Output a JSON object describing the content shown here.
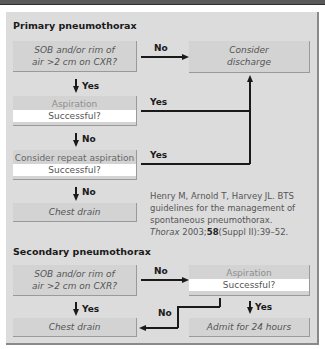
{
  "primary": {
    "title": "Primary pneumothorax",
    "q1": {
      "line1": "SOB and/or rim of",
      "line2": "air >2 cm on CXR?"
    },
    "q1_no": "No",
    "q1_yes": "Yes",
    "discharge": {
      "line1": "Consider",
      "line2": "discharge"
    },
    "aspiration": {
      "head": "Aspiration",
      "question": "Successful?"
    },
    "aspiration_yes": "Yes",
    "aspiration_no": "No",
    "repeat": {
      "head": "Consider repeat aspiration",
      "question": "Successful?"
    },
    "repeat_yes": "Yes",
    "repeat_no": "No",
    "chest_drain": "Chest drain"
  },
  "reference": {
    "line1": "Henry M, Arnold T, Harvey JL. BTS",
    "line2": "guidelines for the management of",
    "line3": "spontaneous pneumothorax.",
    "journal": "Thorax",
    "year": "2003;",
    "volume": "58",
    "pages": "(Suppl II):39–52."
  },
  "secondary": {
    "title": "Secondary pneumothorax",
    "q1": {
      "line1": "SOB and/or rim of",
      "line2": "air >2 cm on CXR?"
    },
    "q1_no": "No",
    "q1_yes": "Yes",
    "aspiration": {
      "head": "Aspiration",
      "question": "Successful?"
    },
    "aspiration_no": "No",
    "aspiration_yes": "Yes",
    "chest_drain": "Chest drain",
    "admit": "Admit for 24 hours"
  }
}
